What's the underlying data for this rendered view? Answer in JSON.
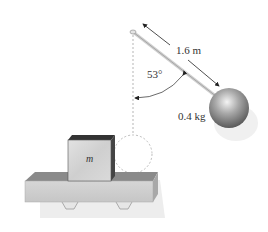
{
  "figure": {
    "type": "physics-diagram",
    "labels": {
      "length": "1.6 m",
      "angle": "53°",
      "ball_mass": "0.4 kg",
      "block_mass": "m"
    },
    "pendulum": {
      "length_m": 1.6,
      "angle_deg": 53,
      "ball_mass_kg": 0.4
    },
    "colors": {
      "ball": "#8a8a8a",
      "ball_highlight": "#f0f0f0",
      "block_front": "#d4d4d4",
      "block_top": "#3a3a3a",
      "platform_front": "#cfcfcf",
      "platform_top": "#7a7a7a",
      "shadow": "#ececec",
      "dashed": "#bdbdbd",
      "text": "#333333"
    }
  }
}
